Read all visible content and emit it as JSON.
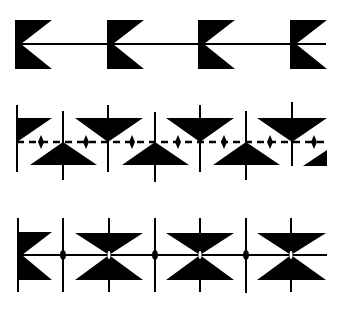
{
  "figure": {
    "background_color": "#ffffff",
    "ink_color": "#000000",
    "rows": [
      {
        "name": "row-1-pennants",
        "motif": "notched-pennant",
        "count": 4,
        "line": "solid"
      },
      {
        "name": "row-2-alternating-triangles",
        "motif": "alternating-up-down-triangles-with-diamonds",
        "count_down_triangles": 3,
        "count_up_triangles": 3,
        "line": "dashed"
      },
      {
        "name": "row-3-bowties",
        "motif": "hourglass-bowtie",
        "count": 3,
        "line": "solid"
      }
    ]
  }
}
